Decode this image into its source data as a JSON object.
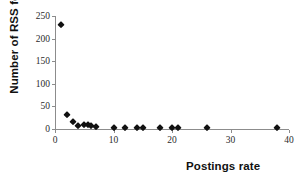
{
  "chart_data": {
    "type": "scatter",
    "title": "",
    "xlabel": "Postings rate",
    "ylabel": "Number of RSS feeds",
    "xlim": [
      0,
      40
    ],
    "ylim": [
      0,
      250
    ],
    "xticks": [
      0,
      10,
      20,
      30,
      40
    ],
    "yticks": [
      0,
      50,
      100,
      150,
      200,
      250
    ],
    "grid": false,
    "legend": false,
    "marker": "diamond",
    "marker_color": "#111111",
    "axis_color": "#8c8c8c",
    "points": [
      {
        "x": 1,
        "y": 230
      },
      {
        "x": 2,
        "y": 31
      },
      {
        "x": 3,
        "y": 16
      },
      {
        "x": 4,
        "y": 7
      },
      {
        "x": 5,
        "y": 8
      },
      {
        "x": 5.6,
        "y": 8
      },
      {
        "x": 6.2,
        "y": 7
      },
      {
        "x": 7,
        "y": 5
      },
      {
        "x": 10,
        "y": 2
      },
      {
        "x": 12,
        "y": 3
      },
      {
        "x": 14,
        "y": 2
      },
      {
        "x": 15,
        "y": 2
      },
      {
        "x": 18,
        "y": 2
      },
      {
        "x": 20,
        "y": 2
      },
      {
        "x": 21,
        "y": 2
      },
      {
        "x": 26,
        "y": 2
      },
      {
        "x": 38,
        "y": 2
      }
    ]
  }
}
